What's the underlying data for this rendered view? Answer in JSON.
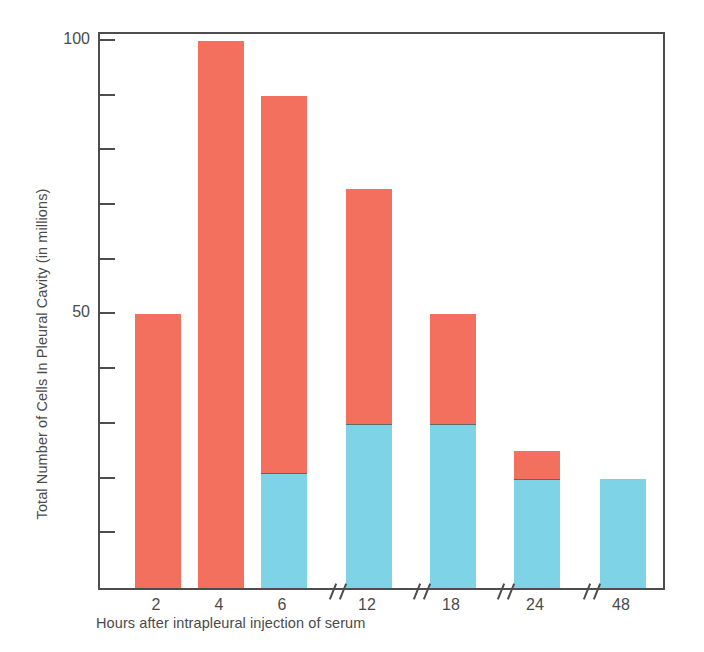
{
  "chart_data": {
    "type": "bar",
    "stacked": true,
    "title": "",
    "xlabel": "Hours after intrapleural injection of serum",
    "ylabel": "Total Number of Cells In Pleural Cavity (in millions)",
    "categories": [
      "2",
      "4",
      "6",
      "12",
      "18",
      "24",
      "48"
    ],
    "series": [
      {
        "name": "lower-segment",
        "color": "#7ed4e6",
        "values": [
          0,
          0,
          21,
          30,
          30,
          20,
          20
        ]
      },
      {
        "name": "upper-segment",
        "color": "#f4705e",
        "values": [
          50,
          100,
          69,
          43,
          20,
          5,
          0
        ]
      }
    ],
    "totals": [
      50,
      100,
      90,
      73,
      50,
      25,
      20
    ],
    "ylim": [
      0,
      102
    ],
    "yticks": [
      10,
      20,
      30,
      40,
      50,
      60,
      70,
      80,
      90,
      100
    ],
    "ytick_labels": [
      "",
      "",
      "",
      "",
      "50",
      "",
      "",
      "",
      "",
      "100"
    ],
    "grid": false,
    "legend": "none",
    "axis_breaks": [
      "6|12",
      "12|18",
      "18|24",
      "24|48"
    ],
    "colors": {
      "red": "#f4705e",
      "blue": "#7ed4e6",
      "axis": "#4d4d4d",
      "text": "#4a4a4a",
      "background": "#ffffff"
    }
  }
}
